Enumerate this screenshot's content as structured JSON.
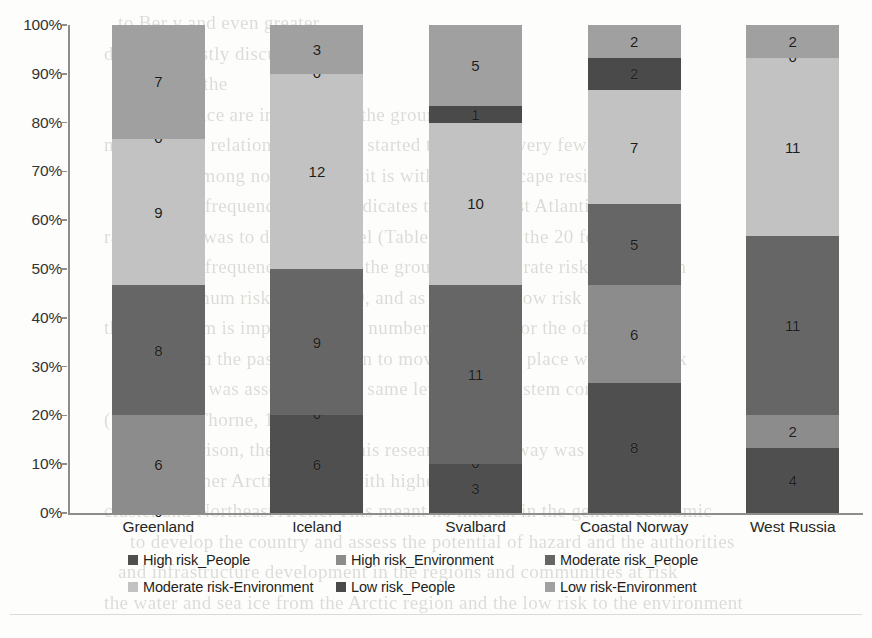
{
  "chart_data": {
    "type": "bar",
    "stacked": true,
    "normalized": "100%",
    "title": "",
    "xlabel": "",
    "ylabel": "",
    "ylim": [
      0,
      100
    ],
    "grid": false,
    "legend_position": "bottom",
    "categories": [
      "Greenland",
      "Iceland",
      "Svalbard",
      "Coastal Norway",
      "West Russia"
    ],
    "y_tick_labels": [
      "100%",
      "90%",
      "80%",
      "70%",
      "60%",
      "50%",
      "40%",
      "30%",
      "20%",
      "10%",
      "0%"
    ],
    "y_tick_values": [
      100,
      90,
      80,
      70,
      60,
      50,
      40,
      30,
      20,
      10,
      0
    ],
    "series": [
      {
        "name": "High risk_People",
        "color": "#4f4f4f",
        "values": [
          0,
          6,
          3,
          8,
          4
        ]
      },
      {
        "name": "High risk_Environment",
        "color": "#8c8c8c",
        "values": [
          6,
          0,
          0,
          6,
          2
        ]
      },
      {
        "name": "Moderate risk_People",
        "color": "#666666",
        "values": [
          8,
          9,
          11,
          5,
          11
        ]
      },
      {
        "name": "Moderate risk-Environment",
        "color": "#c2c2c2",
        "values": [
          9,
          12,
          10,
          7,
          11
        ]
      },
      {
        "name": "Low risk_People",
        "color": "#4a4a4a",
        "values": [
          0,
          0,
          1,
          2,
          0
        ]
      },
      {
        "name": "Low risk-Environment",
        "color": "#a0a0a0",
        "values": [
          7,
          3,
          5,
          2,
          2
        ]
      }
    ],
    "category_totals": [
      30,
      30,
      30,
      30,
      30
    ]
  },
  "legend": {
    "items": [
      {
        "label": "High risk_People",
        "color": "#4f4f4f"
      },
      {
        "label": "High risk_Environment",
        "color": "#8c8c8c"
      },
      {
        "label": "Moderate risk_People",
        "color": "#666666"
      },
      {
        "label": "Moderate risk-Environment",
        "color": "#c2c2c2"
      },
      {
        "label": "Low risk_People",
        "color": "#4a4a4a"
      },
      {
        "label": "Low risk-Environment",
        "color": "#a0a0a0"
      }
    ]
  },
  "background_text": {
    "lines": [
      "to Ber y and even greater",
      "detected mostly discussed in the",
      "hood for the",
      "where the ice are in the sea in the ground",
      "minimal risk relation population started to melt the very few",
      "of sea. Among non-ferry and it is with low landscape residents is",
      "the lowest frequency, which indicates the Northeast Atlantic",
      "range. Only was to different level (Table 20). Inside the 20 features",
      "was a 22 frequency than 2 in the ground of Moderate risk at lowest in",
      "with minimum risk in Table 20, and as minor and low risk ecosystem",
      "the ecosystem is impacted in the number of the ice for the of",
      "risk. As in the past, the human to move. It was in place where the risk",
      "population was assessed in the same level to ecosystem conditions",
      "(Salmon & Thorne, 1998).",
      "Incomparison, the result of this research for Norway was lower",
      "than for other Arctic regions with higher risk",
      "cluster and Northeast Arctic. This meant no interest in the general economic",
      "to develop the country and assess the potential of hazard and the authorities",
      "and infrastructure development in the regions and communities at risk",
      "the water and sea ice from the Arctic region and the low risk to the environment"
    ]
  }
}
